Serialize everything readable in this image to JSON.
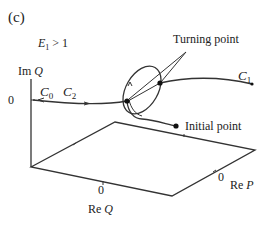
{
  "figure": {
    "panel_label": "(c)",
    "condition": {
      "var": "E",
      "sub": "1",
      "rest": " > 1"
    },
    "axes": {
      "vertical": {
        "prefix": "Im",
        "var": "Q",
        "zero": "0"
      },
      "re_q": {
        "prefix": "Re",
        "var": "Q",
        "zero": "0"
      },
      "re_p": {
        "prefix": "Re",
        "var": "P",
        "zero": "0"
      }
    },
    "curves": {
      "c0": {
        "var": "C",
        "sub": "0"
      },
      "c1": {
        "var": "C",
        "sub": "1"
      },
      "c2": {
        "var": "C",
        "sub": "2"
      }
    },
    "annotations": {
      "turning_point": "Turning point",
      "initial_point": "Initial point"
    }
  }
}
